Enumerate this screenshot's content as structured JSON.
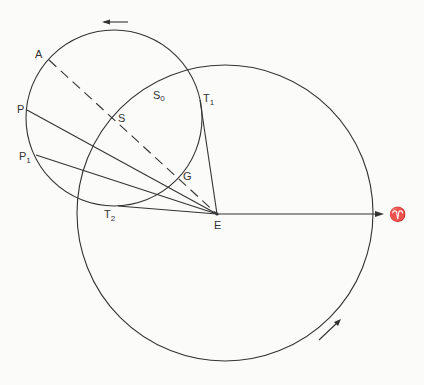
{
  "diagram": {
    "labels": {
      "A": "A",
      "P": "P",
      "P1": "P",
      "P1_sub": "1",
      "S": "S",
      "S0": "S",
      "S0_sub": "0",
      "T1": "T",
      "T1_sub": "1",
      "T2": "T",
      "T2_sub": "2",
      "G": "G",
      "E": "E",
      "aries": "♈"
    },
    "colors": {
      "line": "#333333",
      "background": "#fbfbfa"
    }
  }
}
